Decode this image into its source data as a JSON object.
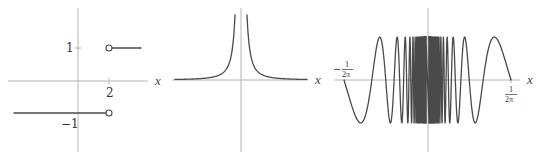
{
  "colors": {
    "axis": "#b4b4b4",
    "curve": "#4a4a4a",
    "background": "#ffffff"
  },
  "chart_data": [
    {
      "type": "line",
      "title": "",
      "description": "Step function: -1 for x < 2, 1 for x > 2 (open circles at x = 2)",
      "xlabel": "x",
      "ylabel": "",
      "x_ticks": [
        {
          "value": 2,
          "label": "2"
        }
      ],
      "y_ticks": [
        {
          "value": 1,
          "label": "1"
        },
        {
          "value": -1,
          "label": "-1"
        }
      ],
      "series": [
        {
          "name": "lower",
          "x": [
            -2.5,
            2
          ],
          "y": [
            -1,
            -1
          ],
          "endpoint": "open-circle-right"
        },
        {
          "name": "upper",
          "x": [
            2,
            3.5
          ],
          "y": [
            1,
            1
          ],
          "endpoint": "open-circle-left"
        }
      ],
      "labels": {
        "x_axis": "x",
        "tick_2": "2",
        "tick_1": "1",
        "tick_neg1": "−1"
      }
    },
    {
      "type": "line",
      "title": "",
      "description": "Curve y = 1/x^2, vertical asymptote at x = 0",
      "xlabel": "x",
      "ylabel": "",
      "function": "1/x^2",
      "labels": {
        "x_axis": "x"
      }
    },
    {
      "type": "line",
      "title": "",
      "description": "y = sin(1/x) on [-1/(2π), 1/(2π)], oscillating infinitely near x = 0",
      "xlabel": "x",
      "ylabel": "",
      "function": "sin(1/x)",
      "xlim": [
        -0.159155,
        0.159155
      ],
      "ylim": [
        -1,
        1
      ],
      "x_ticks": [
        {
          "value": -0.159155,
          "label": "−1/(2π)"
        },
        {
          "value": 0.159155,
          "label": "1/(2π)"
        }
      ],
      "labels": {
        "x_axis": "x",
        "left_num": "1",
        "left_den": "2π",
        "left_sign": "−",
        "right_num": "1",
        "right_den": "2π"
      }
    }
  ]
}
